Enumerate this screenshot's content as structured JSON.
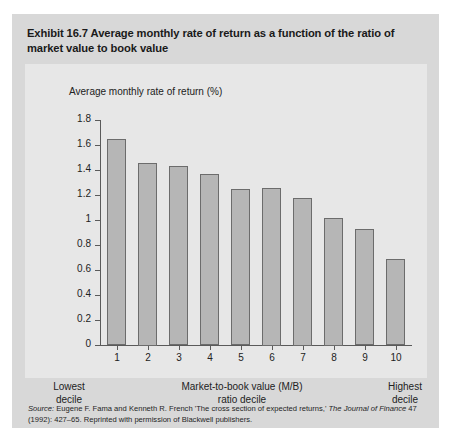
{
  "exhibit": {
    "title": "Exhibit 16.7  Average monthly rate of return as a function of the ratio of market value to book value",
    "panel_bg": "#d8d8d8",
    "plot_bg": "#e7e7e7",
    "bar_fill": "#b6b6b6",
    "bar_stroke": "#6c6c6c"
  },
  "axis_captions": {
    "left": "Lowest\ndecile",
    "left_line1": "Lowest",
    "left_line2": "decile",
    "center_line1": "Market-to-book value (M/B)",
    "center_line2": "ratio decile",
    "right_line1": "Highest",
    "right_line2": "decile"
  },
  "source": {
    "label": "Source:",
    "text_part1": " Eugene F. Fama and Kenneth R. French 'The cross section of expected returns,' ",
    "journal": "The Journal of Finance",
    "text_part2": " 47 (1992): 427–65. Reprinted with permission of Blackwell publishers."
  },
  "chart_data": {
    "type": "bar",
    "title": "Average monthly rate of return as a function of the ratio of market value to book value",
    "subtitle": "",
    "xlabel": "Market-to-book value (M/B) ratio decile",
    "ylabel": "Average monthly rate of return (%)",
    "categories": [
      "1",
      "2",
      "3",
      "4",
      "5",
      "6",
      "7",
      "8",
      "9",
      "10"
    ],
    "values": [
      1.65,
      1.46,
      1.43,
      1.37,
      1.25,
      1.26,
      1.18,
      1.02,
      0.93,
      0.69
    ],
    "ylim": [
      0,
      1.8
    ],
    "ytick_labels": [
      "0",
      "0.2",
      "0.4",
      "0.6",
      "0.8",
      "1",
      "1.2",
      "1.4",
      "1.6",
      "1.8"
    ],
    "ytick_values": [
      0,
      0.2,
      0.4,
      0.6,
      0.8,
      1,
      1.2,
      1.4,
      1.6,
      1.8
    ],
    "grid": false,
    "legend": "none"
  }
}
